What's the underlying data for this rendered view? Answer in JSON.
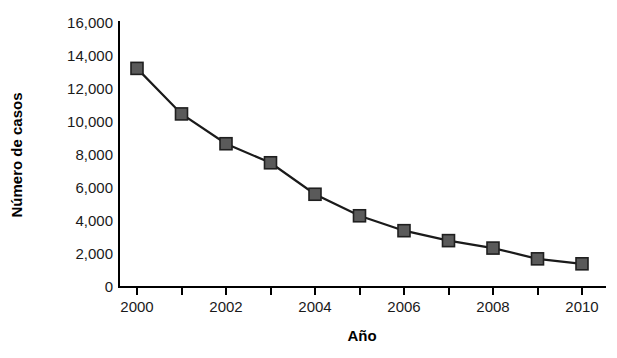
{
  "chart_data": {
    "type": "line",
    "title": "",
    "xlabel": "Año",
    "ylabel": "Número de casos",
    "x": [
      2000,
      2001,
      2002,
      2003,
      2004,
      2005,
      2006,
      2007,
      2008,
      2009,
      2010
    ],
    "values": [
      13200,
      10450,
      8650,
      7500,
      5600,
      4300,
      3400,
      2800,
      2350,
      1700,
      1400
    ],
    "series": [
      {
        "name": "Número de casos",
        "values": [
          13200,
          10450,
          8650,
          7500,
          5600,
          4300,
          3400,
          2800,
          2350,
          1700,
          1400
        ]
      }
    ],
    "xlim": [
      2000,
      2010
    ],
    "ylim": [
      0,
      16000
    ],
    "x_tick_values": [
      2000,
      2001,
      2002,
      2003,
      2004,
      2005,
      2006,
      2007,
      2008,
      2009,
      2010
    ],
    "x_tick_labels": [
      "2000",
      "",
      "2002",
      "",
      "2004",
      "",
      "2006",
      "",
      "2008",
      "",
      "2010"
    ],
    "y_tick_values": [
      0,
      2000,
      4000,
      6000,
      8000,
      10000,
      12000,
      14000,
      16000
    ],
    "y_tick_labels": [
      "0",
      "2,000",
      "4,000",
      "6,000",
      "8,000",
      "10,000",
      "12,000",
      "14,000",
      "16,000"
    ],
    "grid": false,
    "legend": "none",
    "marker": "square",
    "colors": {
      "line": "#1a1a1a",
      "marker_fill": "#5a5a5a",
      "marker_stroke": "#1f1f1f",
      "axis": "#000000",
      "text": "#1a1a1a",
      "background": "#ffffff"
    }
  }
}
